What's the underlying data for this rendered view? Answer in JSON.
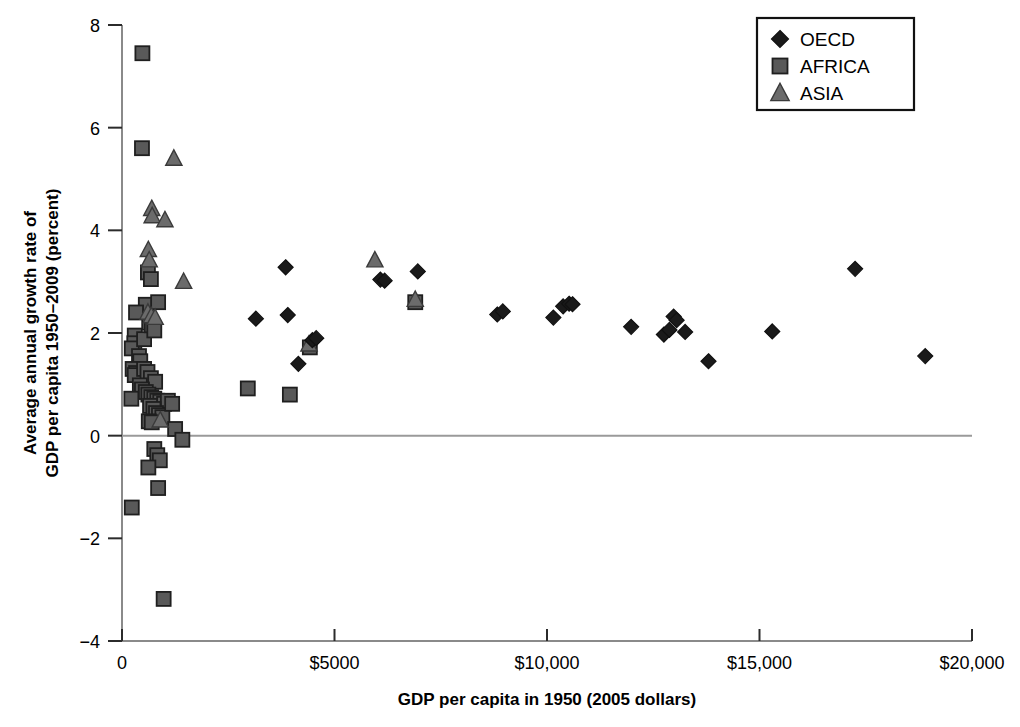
{
  "chart_data": {
    "type": "scatter",
    "title": "",
    "xlabel": "GDP per capita in 1950 (2005 dollars)",
    "ylabel": "Average annual growth rate of GDP per capita 1950–2009 (percent)",
    "ylabel_line1": "Average annual growth rate of",
    "ylabel_line2": "GDP per capita 1950–2009 (percent)",
    "xlim": [
      0,
      20000
    ],
    "ylim": [
      -4,
      8
    ],
    "grid": false,
    "zero_line": true,
    "legend_position": "top-right",
    "xticks": [
      0,
      5000,
      10000,
      15000,
      20000
    ],
    "xticklabels": [
      "0",
      "$5000",
      "$10,000",
      "$15,000",
      "$20,000"
    ],
    "yticks": [
      -4,
      -2,
      0,
      2,
      4,
      6,
      8
    ],
    "yticklabels": [
      "−4",
      "−2",
      "0",
      "2",
      "4",
      "6",
      "8"
    ],
    "colors": {
      "oecd": "#1a1a1a",
      "africa": "#595959",
      "asia": "#6b6b6b",
      "marker_edge": "#111111",
      "axis": "#8a8a8a",
      "zero_line": "#9a9a9a",
      "text": "#000000"
    },
    "series": [
      {
        "name": "OECD",
        "marker": "diamond",
        "color": "#1a1a1a",
        "points": [
          [
            3150,
            2.28
          ],
          [
            3850,
            3.28
          ],
          [
            3900,
            2.35
          ],
          [
            4150,
            1.4
          ],
          [
            4480,
            1.86
          ],
          [
            4570,
            1.9
          ],
          [
            6080,
            3.04
          ],
          [
            6180,
            3.02
          ],
          [
            6960,
            3.2
          ],
          [
            8830,
            2.36
          ],
          [
            8960,
            2.42
          ],
          [
            10150,
            2.3
          ],
          [
            10380,
            2.52
          ],
          [
            10520,
            2.57
          ],
          [
            10600,
            2.56
          ],
          [
            11980,
            2.12
          ],
          [
            12750,
            1.97
          ],
          [
            12880,
            2.06
          ],
          [
            12980,
            2.32
          ],
          [
            13050,
            2.25
          ],
          [
            13250,
            2.02
          ],
          [
            13800,
            1.45
          ],
          [
            15300,
            2.03
          ],
          [
            17250,
            3.25
          ],
          [
            18900,
            1.55
          ]
        ]
      },
      {
        "name": "AFRICA",
        "marker": "square",
        "color": "#595959",
        "points": [
          [
            480,
            7.45
          ],
          [
            470,
            5.6
          ],
          [
            610,
            3.18
          ],
          [
            680,
            3.05
          ],
          [
            560,
            2.55
          ],
          [
            850,
            2.6
          ],
          [
            330,
            2.4
          ],
          [
            300,
            1.95
          ],
          [
            290,
            1.8
          ],
          [
            230,
            1.7
          ],
          [
            520,
            1.88
          ],
          [
            640,
            2.2
          ],
          [
            700,
            2.15
          ],
          [
            760,
            2.05
          ],
          [
            400,
            1.55
          ],
          [
            430,
            1.45
          ],
          [
            250,
            1.3
          ],
          [
            330,
            1.22
          ],
          [
            300,
            1.18
          ],
          [
            520,
            1.3
          ],
          [
            600,
            1.24
          ],
          [
            680,
            1.12
          ],
          [
            780,
            1.05
          ],
          [
            420,
            0.98
          ],
          [
            470,
            0.9
          ],
          [
            560,
            0.85
          ],
          [
            620,
            0.8
          ],
          [
            690,
            0.75
          ],
          [
            760,
            0.72
          ],
          [
            830,
            0.68
          ],
          [
            900,
            0.66
          ],
          [
            990,
            0.62
          ],
          [
            1080,
            0.68
          ],
          [
            220,
            0.72
          ],
          [
            660,
            0.58
          ],
          [
            740,
            0.52
          ],
          [
            800,
            0.44
          ],
          [
            870,
            0.4
          ],
          [
            950,
            0.36
          ],
          [
            630,
            0.28
          ],
          [
            700,
            0.26
          ],
          [
            1180,
            0.62
          ],
          [
            1250,
            0.13
          ],
          [
            1420,
            -0.08
          ],
          [
            2960,
            0.92
          ],
          [
            3950,
            0.8
          ],
          [
            4420,
            1.72
          ],
          [
            6900,
            2.6
          ],
          [
            760,
            -0.26
          ],
          [
            830,
            -0.38
          ],
          [
            890,
            -0.48
          ],
          [
            620,
            -0.62
          ],
          [
            850,
            -1.02
          ],
          [
            230,
            -1.4
          ],
          [
            980,
            -3.18
          ]
        ]
      },
      {
        "name": "ASIA",
        "marker": "triangle",
        "color": "#6b6b6b",
        "points": [
          [
            1220,
            5.4
          ],
          [
            700,
            4.42
          ],
          [
            710,
            4.28
          ],
          [
            1010,
            4.2
          ],
          [
            620,
            3.62
          ],
          [
            640,
            3.42
          ],
          [
            1450,
            3.0
          ],
          [
            610,
            2.4
          ],
          [
            690,
            2.33
          ],
          [
            780,
            2.3
          ],
          [
            5950,
            3.42
          ],
          [
            6900,
            2.65
          ],
          [
            4400,
            1.78
          ],
          [
            900,
            0.3
          ]
        ]
      }
    ]
  },
  "legend": {
    "items": [
      {
        "label": "OECD",
        "marker": "diamond",
        "color": "#1a1a1a"
      },
      {
        "label": "AFRICA",
        "marker": "square",
        "color": "#595959"
      },
      {
        "label": "ASIA",
        "marker": "triangle",
        "color": "#6b6b6b"
      }
    ]
  }
}
